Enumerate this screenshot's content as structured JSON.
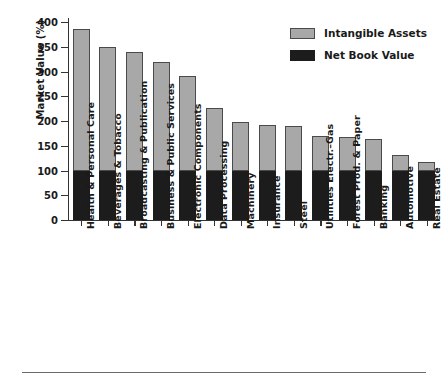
{
  "chart_data": {
    "type": "bar",
    "stacked": true,
    "title": "",
    "xlabel": "",
    "ylabel": "Market Value (%)",
    "ylim": [
      0,
      400
    ],
    "yticks": [
      0,
      50,
      100,
      150,
      200,
      250,
      300,
      350,
      400
    ],
    "ytick_labels": [
      "0",
      "50",
      "100",
      "150",
      "200",
      "250",
      "300",
      "350",
      "400"
    ],
    "grid": false,
    "legend_position": "top-right",
    "categories": [
      "Health & Personal Care",
      "Beverages & Tobacco",
      "Broadcasting & Publication",
      "Business & Public Services",
      "Electronic Components",
      "Data Processing",
      "Machinery",
      "Insurance",
      "Steel",
      "Utilities Electr.–Gas",
      "Forest Prod. & Paper",
      "Banking",
      "Automotive",
      "Real Estate"
    ],
    "series": [
      {
        "name": "Net Book Value",
        "color": "#1c1c1c",
        "values": [
          100,
          100,
          100,
          100,
          100,
          100,
          100,
          100,
          100,
          100,
          100,
          100,
          100,
          100
        ]
      },
      {
        "name": "Intangible Assets",
        "color": "#a8a8a8",
        "values": [
          285,
          250,
          240,
          219,
          191,
          126,
          98,
          91,
          89,
          69,
          67,
          63,
          31,
          17
        ]
      }
    ],
    "totals": [
      385,
      350,
      340,
      319,
      291,
      226,
      198,
      191,
      189,
      169,
      167,
      163,
      131,
      117
    ]
  },
  "legend": {
    "items": [
      {
        "label": "Intangible Assets",
        "swatch": "intangible"
      },
      {
        "label": "Net Book Value",
        "swatch": "netbook"
      }
    ]
  },
  "colors": {
    "intangible": "#a8a8a8",
    "net_book_value": "#1c1c1c",
    "axis": "#333333",
    "rule": "#6b6b6b"
  }
}
